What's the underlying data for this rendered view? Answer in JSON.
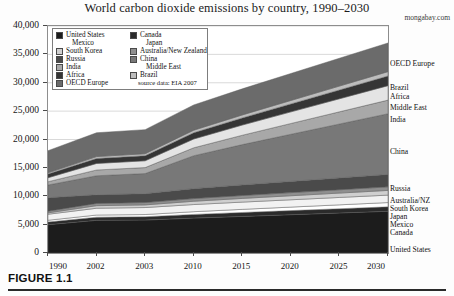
{
  "figure": {
    "caption": "FIGURE 1.1",
    "watermark": "mongabay.com"
  },
  "legend": {
    "source_note": "source data: EIA 2007",
    "left_column": [
      {
        "label": "United States",
        "color": "#1c1c1c",
        "swatch": true
      },
      {
        "label": "Mexico",
        "color": "#ffffff",
        "swatch": false
      },
      {
        "label": "South Korea",
        "color": "#cfcfcf",
        "swatch": true
      },
      {
        "label": "Russia",
        "color": "#4a4a4a",
        "swatch": true
      },
      {
        "label": "India",
        "color": "#a8a8a8",
        "swatch": true
      },
      {
        "label": "Africa",
        "color": "#353535",
        "swatch": true
      },
      {
        "label": "OECD Europe",
        "color": "#6b6b6b",
        "swatch": true
      }
    ],
    "right_column": [
      {
        "label": "Canada",
        "color": "#2b2b2b",
        "swatch": true
      },
      {
        "label": "Japan",
        "color": "#f2f2f2",
        "swatch": false
      },
      {
        "label": "Australia/New Zealand",
        "color": "#8f8f8f",
        "swatch": true
      },
      {
        "label": "China",
        "color": "#787878",
        "swatch": true
      },
      {
        "label": "Middle East",
        "color": "#e4e4e4",
        "swatch": false
      },
      {
        "label": "Brazil",
        "color": "#bdbdbd",
        "swatch": true
      }
    ]
  },
  "series_labels": [
    {
      "label": "OECD Europe",
      "y": 38
    },
    {
      "label": "Brazil",
      "y": 62
    },
    {
      "label": "Africa",
      "y": 71
    },
    {
      "label": "Middle East",
      "y": 82
    },
    {
      "label": "India",
      "y": 94
    },
    {
      "label": "China",
      "y": 126
    },
    {
      "label": "Russia",
      "y": 163
    },
    {
      "label": "Australia/NZ",
      "y": 175
    },
    {
      "label": "South Korea",
      "y": 183
    },
    {
      "label": "Japan",
      "y": 191
    },
    {
      "label": "Mexico",
      "y": 199
    },
    {
      "label": "Canada",
      "y": 207
    },
    {
      "label": "United States",
      "y": 224
    }
  ],
  "chart_data": {
    "type": "area",
    "stacked": true,
    "title": "World carbon dioxide emissions by country, 1990–2030",
    "xlabel": "",
    "ylabel": "",
    "ylim": [
      0,
      40000
    ],
    "ytick_step": 5000,
    "ytick_labels": [
      "0",
      "5,000",
      "10,000",
      "15,000",
      "20,000",
      "25,000",
      "30,000",
      "35,000",
      "40,000"
    ],
    "grid": true,
    "legend_position": "upper-left",
    "source": "source data: EIA 2007",
    "units": "million metric tons CO2",
    "categories": [
      "1990",
      "2002",
      "2003",
      "2010",
      "2015",
      "2020",
      "2025",
      "2030"
    ],
    "series": [
      {
        "name": "United States",
        "color": "#1c1c1c",
        "values": [
          5000,
          5750,
          5800,
          6150,
          6450,
          6750,
          7050,
          7350
        ]
      },
      {
        "name": "Canada",
        "color": "#2b2b2b",
        "values": [
          460,
          560,
          590,
          650,
          690,
          720,
          750,
          780
        ]
      },
      {
        "name": "Mexico",
        "color": "#ffffff",
        "values": [
          310,
          380,
          390,
          480,
          550,
          620,
          690,
          760
        ]
      },
      {
        "name": "Japan",
        "color": "#f2f2f2",
        "values": [
          1060,
          1200,
          1230,
          1260,
          1280,
          1290,
          1300,
          1310
        ]
      },
      {
        "name": "South Korea",
        "color": "#cfcfcf",
        "values": [
          240,
          450,
          470,
          580,
          650,
          710,
          770,
          830
        ]
      },
      {
        "name": "Australia/New Zealand",
        "color": "#8f8f8f",
        "values": [
          290,
          400,
          410,
          470,
          510,
          550,
          590,
          630
        ]
      },
      {
        "name": "Russia",
        "color": "#4a4a4a",
        "values": [
          2380,
          1520,
          1560,
          1750,
          1870,
          1980,
          2080,
          2180
        ]
      },
      {
        "name": "China",
        "color": "#787878",
        "values": [
          2240,
          3350,
          3550,
          5800,
          7100,
          8300,
          9500,
          10700
        ]
      },
      {
        "name": "India",
        "color": "#a8a8a8",
        "values": [
          580,
          1020,
          1050,
          1400,
          1650,
          1900,
          2150,
          2400
        ]
      },
      {
        "name": "Middle East",
        "color": "#e4e4e4",
        "values": [
          700,
          1150,
          1200,
          1550,
          1800,
          2050,
          2300,
          2550
        ]
      },
      {
        "name": "Africa",
        "color": "#353535",
        "values": [
          650,
          880,
          900,
          1100,
          1250,
          1400,
          1550,
          1700
        ]
      },
      {
        "name": "Brazil",
        "color": "#bdbdbd",
        "values": [
          220,
          330,
          340,
          450,
          530,
          610,
          690,
          770
        ]
      },
      {
        "name": "OECD Europe",
        "color": "#6b6b6b",
        "values": [
          3900,
          4200,
          4250,
          4450,
          4600,
          4750,
          4900,
          5050
        ]
      }
    ]
  }
}
